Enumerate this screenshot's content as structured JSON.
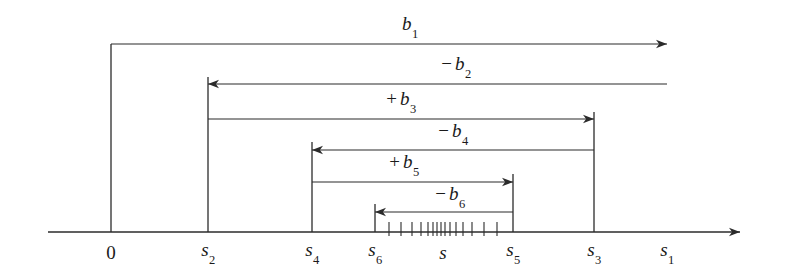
{
  "figure": {
    "type": "number-line-interval-diagram",
    "width": 801,
    "height": 273,
    "background": "#ffffff",
    "stroke_color": "#2b2b2b"
  },
  "axis": {
    "name": "number-line",
    "y": 232,
    "x_start": 48,
    "x_end": 740,
    "arrow": "right",
    "ticks": [
      {
        "id": "t0",
        "label": "0",
        "sub": "",
        "x": 111
      },
      {
        "id": "ts2",
        "label": "s",
        "sub": "2",
        "x": 208
      },
      {
        "id": "ts4",
        "label": "s",
        "sub": "4",
        "x": 312
      },
      {
        "id": "ts6",
        "label": "s",
        "sub": "6",
        "x": 375
      },
      {
        "id": "ts",
        "label": "s",
        "sub": "",
        "x": 443
      },
      {
        "id": "ts5",
        "label": "s",
        "sub": "5",
        "x": 513
      },
      {
        "id": "ts3",
        "label": "s",
        "sub": "3",
        "x": 594
      },
      {
        "id": "ts1",
        "label": "s",
        "sub": "1",
        "x": 667
      }
    ],
    "label_y": 252,
    "small_ticks": {
      "description": "cluster of small hash marks converging near s",
      "y_top": 222,
      "y_bottom": 236,
      "x_positions": [
        389,
        401,
        412,
        421,
        428,
        433,
        437,
        441,
        445,
        450,
        456,
        463,
        472,
        484,
        497
      ]
    }
  },
  "bars": [
    {
      "id": "b1",
      "sign": "",
      "label": "b",
      "sub": "1",
      "row_y": 44,
      "from_x": 111,
      "to_x": 667,
      "arrow_dir": "right",
      "label_x": 410,
      "label_y": 26,
      "stem_from": {
        "tick": "0",
        "x": 111,
        "y_top": 44,
        "y_bottom": 232
      }
    },
    {
      "id": "b2",
      "sign": "−",
      "label": "b",
      "sub": "2",
      "row_y": 84,
      "from_x": 667,
      "to_x": 208,
      "arrow_dir": "left",
      "label_x": 456,
      "label_y": 66,
      "stem_from": {
        "tick": "s2",
        "x": 208,
        "y_top": 77,
        "y_bottom": 232
      }
    },
    {
      "id": "b3",
      "sign": "+",
      "label": "b",
      "sub": "3",
      "row_y": 119,
      "from_x": 208,
      "to_x": 594,
      "arrow_dir": "right",
      "label_x": 401,
      "label_y": 101,
      "stem_from": {
        "tick": "s3",
        "x": 594,
        "y_top": 112,
        "y_bottom": 232
      }
    },
    {
      "id": "b4",
      "sign": "−",
      "label": "b",
      "sub": "4",
      "row_y": 150,
      "from_x": 594,
      "to_x": 312,
      "arrow_dir": "left",
      "label_x": 453,
      "label_y": 133,
      "stem_from": {
        "tick": "s4",
        "x": 312,
        "y_top": 142,
        "y_bottom": 232
      }
    },
    {
      "id": "b5",
      "sign": "+",
      "label": "b",
      "sub": "5",
      "row_y": 182,
      "from_x": 312,
      "to_x": 513,
      "arrow_dir": "right",
      "label_x": 404,
      "label_y": 164,
      "stem_from": {
        "tick": "s5",
        "x": 513,
        "y_top": 174,
        "y_bottom": 232
      }
    },
    {
      "id": "b6",
      "sign": "−",
      "label": "b",
      "sub": "6",
      "row_y": 212,
      "from_x": 513,
      "to_x": 375,
      "arrow_dir": "left",
      "label_x": 450,
      "label_y": 196,
      "stem_from": {
        "tick": "s6",
        "x": 375,
        "y_top": 204,
        "y_bottom": 232
      }
    }
  ]
}
